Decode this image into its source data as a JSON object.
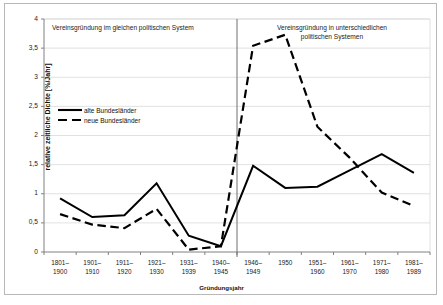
{
  "chart_data": {
    "type": "line",
    "title": "",
    "xlabel": "Gründungsjahr",
    "ylabel": "relative zeitliche Dichte [%/Jahr]",
    "ylim": [
      0,
      4
    ],
    "yticks": [
      "0",
      "0,5",
      "1",
      "1,5",
      "2",
      "2,5",
      "3",
      "3,5",
      "4"
    ],
    "ytick_values": [
      0,
      0.5,
      1,
      1.5,
      2,
      2.5,
      3,
      3.5,
      4
    ],
    "grid": "horizontal",
    "legend_position": "inside-upper-left",
    "categories": [
      "1801–\n1900",
      "1901–\n1910",
      "1911–\n1920",
      "1921–\n1930",
      "1931–\n1939",
      "1940–\n1945",
      "1946–\n1949",
      "1950",
      "1951–\n1960",
      "1961–\n1970",
      "1971–\n1980",
      "1981–\n1989"
    ],
    "categories_line1": [
      "1801–",
      "1901–",
      "1911–",
      "1921–",
      "1931–",
      "1940–",
      "1946–",
      "1950",
      "1951–",
      "1961–",
      "1971–",
      "1981–"
    ],
    "categories_line2": [
      "1900",
      "1910",
      "1920",
      "1930",
      "1939",
      "1945",
      "1949",
      "",
      "1960",
      "1970",
      "1980",
      "1989"
    ],
    "series": [
      {
        "name": "alte Bundesländer",
        "style": "solid",
        "color": "#000000",
        "values": [
          0.92,
          0.6,
          0.63,
          1.18,
          0.28,
          0.1,
          1.48,
          1.1,
          1.12,
          1.4,
          1.68,
          1.36
        ]
      },
      {
        "name": "neue Bundesländer",
        "style": "dashed",
        "color": "#000000",
        "values": [
          0.65,
          0.47,
          0.41,
          0.74,
          0.04,
          0.1,
          3.54,
          3.73,
          2.15,
          1.62,
          1.02,
          0.79
        ]
      }
    ],
    "annotations": [
      {
        "name": "left-region-label",
        "text": "Vereinsgründung im gleichen politischen System"
      },
      {
        "name": "right-region-label",
        "line1": "Vereinsgründung in unterschiedlichen",
        "line2": "politischen Systemen"
      }
    ],
    "divider": {
      "at_category": "1940–1945",
      "description": "vertical separator line"
    }
  },
  "legend": {
    "items": [
      {
        "label": "alte Bundesländer",
        "style": "solid"
      },
      {
        "label": "neue Bundesländer",
        "style": "dashed"
      }
    ]
  },
  "colors": {
    "line": "#000000",
    "grid": "#d9d9d9",
    "axis": "#808080",
    "frame": "#b8b8b8",
    "text": "#1a1a1a",
    "background": "#ffffff"
  }
}
